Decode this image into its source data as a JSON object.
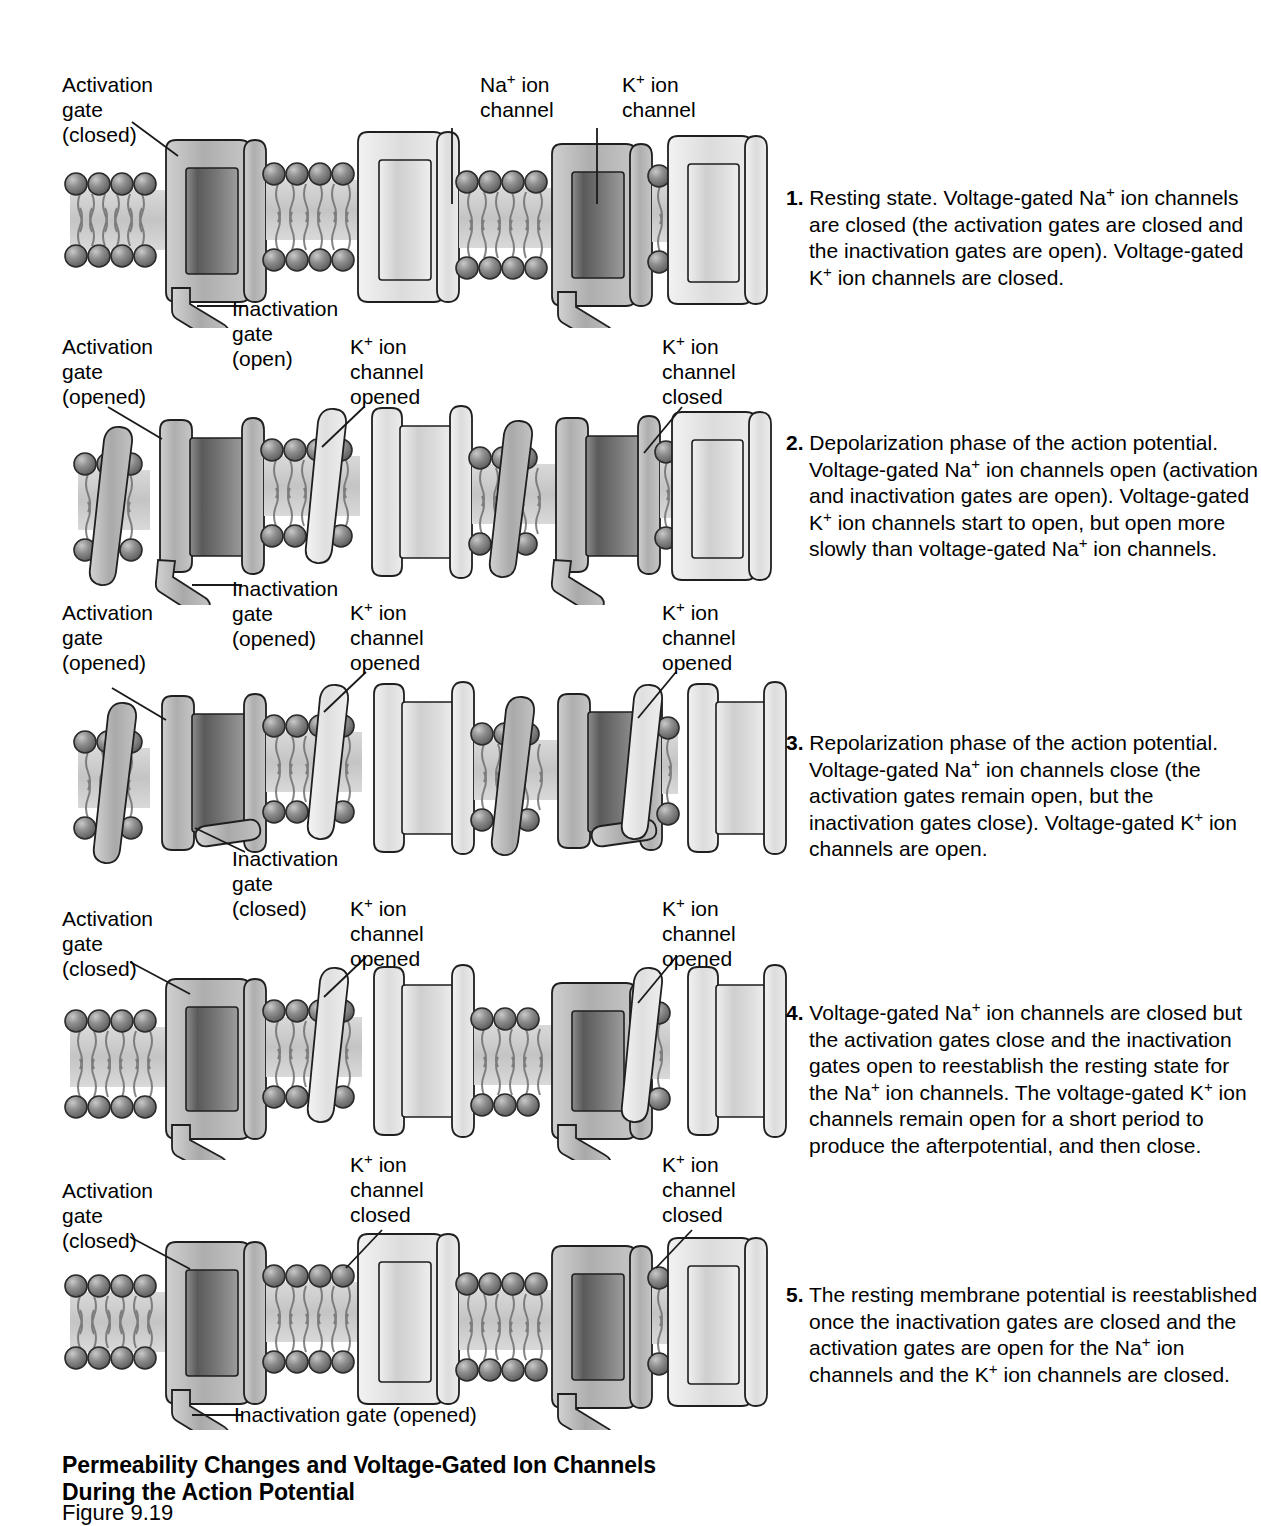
{
  "figure": {
    "title_line1": "Permeability Changes and Voltage-Gated Ion Channels",
    "title_line2": "During the Action Potential",
    "figure_number": "Figure 9.19"
  },
  "colors": {
    "na_channel_dark": "#6e6e6e",
    "na_channel_wall": "#b0b0b0",
    "k_channel_light": "#d8d8d8",
    "k_channel_wall": "#e8e8e8",
    "membrane_interior": "#d0d0d0",
    "lipid_head": "#8a8a8a",
    "outline": "#1a1a1a",
    "text": "#000000"
  },
  "panels": [
    {
      "id": "panel-1",
      "state": "resting",
      "labels": [
        {
          "name": "activation-gate-label",
          "text": "Activation\ngate\n(closed)"
        },
        {
          "name": "na-ion-channel-label",
          "text": "Na+ ion\nchannel"
        },
        {
          "name": "k-ion-channel-label",
          "text": "K+ ion\nchannel"
        },
        {
          "name": "inactivation-gate-label",
          "text": "Inactivation\ngate\n(open)"
        }
      ]
    },
    {
      "id": "panel-2",
      "state": "depolarization",
      "labels": [
        {
          "name": "activation-gate-label",
          "text": "Activation\ngate\n(opened)"
        },
        {
          "name": "inactivation-gate-label",
          "text": "Inactivation\ngate\n(opened)"
        },
        {
          "name": "k-channel-left-label",
          "text": "K+ ion\nchannel\nopened"
        },
        {
          "name": "k-channel-right-label",
          "text": "K+ ion\nchannel\nclosed"
        }
      ]
    },
    {
      "id": "panel-3",
      "state": "repolarization",
      "labels": [
        {
          "name": "activation-gate-label",
          "text": "Activation\ngate\n(opened)"
        },
        {
          "name": "inactivation-gate-label",
          "text": "Inactivation\ngate\n(closed)"
        },
        {
          "name": "k-channel-left-label",
          "text": "K+ ion\nchannel\nopened"
        },
        {
          "name": "k-channel-right-label",
          "text": "K+ ion\nchannel\nopened"
        }
      ]
    },
    {
      "id": "panel-4",
      "state": "afterpotential",
      "labels": [
        {
          "name": "activation-gate-label",
          "text": "Activation\ngate\n(closed)"
        },
        {
          "name": "k-channel-left-label",
          "text": "K+ ion\nchannel\nopened"
        },
        {
          "name": "k-channel-right-label",
          "text": "K+ ion\nchannel\nopened"
        }
      ]
    },
    {
      "id": "panel-5",
      "state": "resting-reestablished",
      "labels": [
        {
          "name": "activation-gate-label",
          "text": "Activation\ngate\n(closed)"
        },
        {
          "name": "k-channel-left-label",
          "text": "K+ ion\nchannel\nclosed"
        },
        {
          "name": "k-channel-right-label",
          "text": "K+ ion\nchannel\nclosed"
        },
        {
          "name": "inactivation-gate-label",
          "text": "Inactivation gate (opened)"
        }
      ]
    }
  ],
  "labels_flat": {
    "p1_activation": "Activation\ngate\n(closed)",
    "p1_na_channel": "Na+ ion\nchannel",
    "p1_k_channel": "K+ ion\nchannel",
    "p1_inactivation": "Inactivation\ngate\n(open)",
    "p2_activation": "Activation\ngate\n(opened)",
    "p2_inactivation": "Inactivation\ngate\n(opened)",
    "p2_k_left": "K+ ion\nchannel\nopened",
    "p2_k_right": "K+ ion\nchannel\nclosed",
    "p3_activation": "Activation\ngate\n(opened)",
    "p3_inactivation": "Inactivation\ngate\n(closed)",
    "p3_k_left": "K+ ion\nchannel\nopened",
    "p3_k_right": "K+ ion\nchannel\nopened",
    "p4_activation": "Activation\ngate\n(closed)",
    "p4_k_left": "K+ ion\nchannel\nopened",
    "p4_k_right": "K+ ion\nchannel\nopened",
    "p5_activation": "Activation\ngate\n(closed)",
    "p5_k_left": "K+ ion\nchannel\nclosed",
    "p5_k_right": "K+ ion\nchannel\nclosed",
    "p5_inactivation": "Inactivation gate (opened)"
  },
  "steps": [
    {
      "number": "1.",
      "text": "Resting state. Voltage-gated Na+ ion channels are closed (the activation gates are closed and the inactivation gates are open). Voltage-gated K+ ion channels are closed."
    },
    {
      "number": "2.",
      "text": "Depolarization phase of the action potential. Voltage-gated Na+ ion channels open (activation and inactivation gates are open). Voltage-gated K+ ion channels start to open, but open more slowly than voltage-gated Na+ ion channels."
    },
    {
      "number": "3.",
      "text": "Repolarization phase of the action potential. Voltage-gated Na+ ion channels close (the activation gates remain open, but the inactivation gates close). Voltage-gated K+ ion channels are open."
    },
    {
      "number": "4.",
      "text": "Voltage-gated Na+ ion channels are closed but the activation gates close and  the inactivation gates open to reestablish the resting state for the Na+ ion channels. The voltage-gated K+ ion channels remain open for a short period to produce the afterpotential, and then close."
    },
    {
      "number": "5.",
      "text": "The resting membrane potential is reestablished once the inactivation gates are closed and the activation gates are open for the Na+ ion channels and the K+ ion channels are closed."
    }
  ]
}
